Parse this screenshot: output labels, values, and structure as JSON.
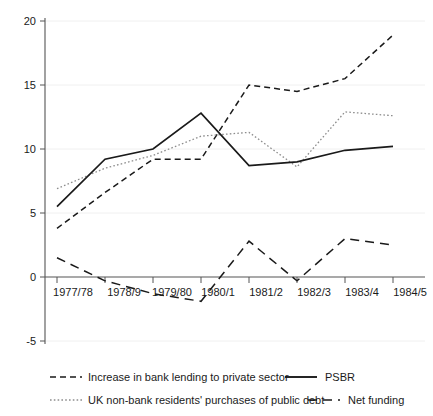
{
  "chart_data": {
    "type": "line",
    "title": "",
    "subtitle": "",
    "xlabel": "",
    "ylabel": "",
    "categories": [
      "1977/78",
      "1978/9",
      "1979/80",
      "1980/1",
      "1981/2",
      "1982/3",
      "1983/4",
      "1984/5"
    ],
    "ylim": [
      -5,
      20
    ],
    "yticks": [
      -5,
      0,
      5,
      10,
      15,
      20
    ],
    "ytick_labels": [
      "-5",
      "0",
      "5",
      "10",
      "15",
      "20"
    ],
    "grid": true,
    "grid_axis": "y",
    "legend_position": "bottom",
    "series": [
      {
        "name": "Increase in bank lending to private sector",
        "style": "dashed",
        "color": "#1a1a1a",
        "values": [
          3.8,
          6.6,
          9.2,
          9.2,
          15.0,
          14.5,
          15.5,
          18.9
        ]
      },
      {
        "name": "PSBR",
        "style": "solid",
        "color": "#1a1a1a",
        "values": [
          5.5,
          9.2,
          10.0,
          12.8,
          8.7,
          9.0,
          9.9,
          10.2
        ]
      },
      {
        "name": "UK non-bank residents' purchases of public debt",
        "style": "dotted",
        "color": "#8d8d8d",
        "values": [
          6.9,
          8.5,
          9.5,
          11.0,
          11.3,
          8.6,
          12.9,
          12.6
        ]
      },
      {
        "name": "Net funding",
        "style": "long-dashed",
        "color": "#1a1a1a",
        "values": [
          1.5,
          -0.3,
          -1.3,
          -1.9,
          2.8,
          -0.3,
          3.0,
          2.5
        ]
      }
    ]
  },
  "axes": {
    "y_tick_labels": [
      "20",
      "15",
      "10",
      "5",
      "0",
      "-5"
    ],
    "x_tick_labels": [
      "1977/78",
      "1978/9",
      "1979/80",
      "1980/1",
      "1981/2",
      "1982/3",
      "1983/4",
      "1984/5"
    ]
  },
  "legend": {
    "entries": [
      {
        "label": "Increase in bank lending to private sector",
        "style": "dashed",
        "color": "#1a1a1a"
      },
      {
        "label": "PSBR",
        "style": "solid",
        "color": "#1a1a1a"
      },
      {
        "label": "UK non-bank residents' purchases of public debt",
        "style": "dotted",
        "color": "#8d8d8d"
      },
      {
        "label": "Net funding",
        "style": "long-dashed",
        "color": "#1a1a1a"
      }
    ]
  },
  "colors": {
    "background": "#ffffff",
    "ink": "#1a1a1a",
    "axis": "#555555",
    "grid": "#f0f0f0",
    "muted": "#8d8d8d"
  }
}
